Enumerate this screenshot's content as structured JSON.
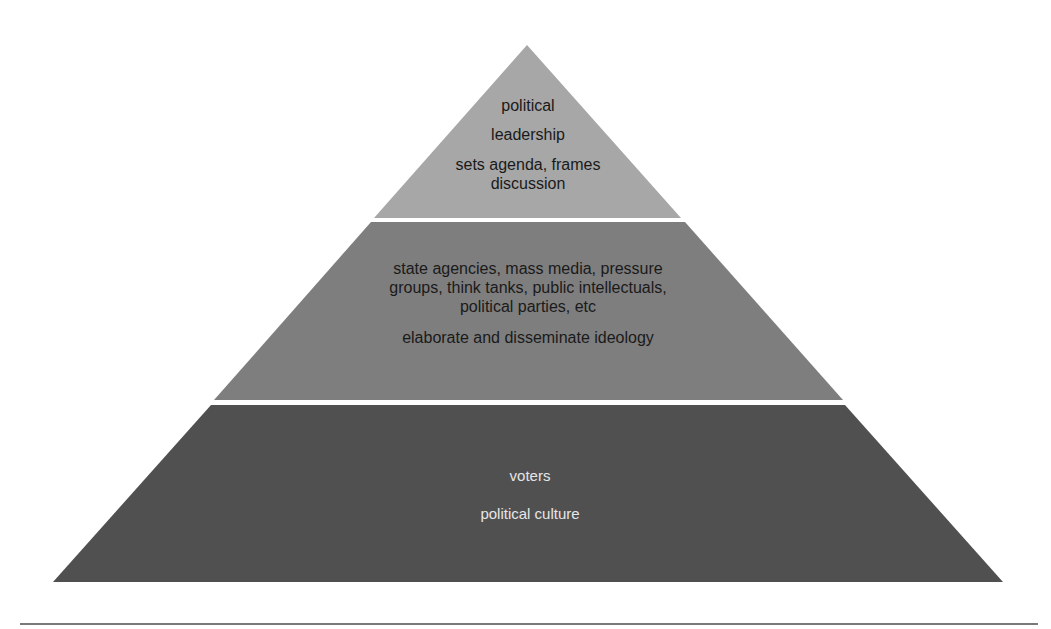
{
  "diagram": {
    "type": "pyramid",
    "colors": {
      "top": "#a7a7a7",
      "middle": "#7e7e7e",
      "bottom": "#505050",
      "separator": "#ffffff",
      "dark_text": "#1a1a1a",
      "light_text": "#e6e6e6"
    },
    "tiers": [
      {
        "id": "top",
        "title_line1": "political",
        "title_line2": "leadership",
        "role_line1": "sets agenda, frames",
        "role_line2": "discussion"
      },
      {
        "id": "middle",
        "actors_line1": "state agencies, mass media, pressure",
        "actors_line2": "groups, think tanks, public intellectuals,",
        "actors_line3": "political parties, etc",
        "role": "elaborate and disseminate ideology"
      },
      {
        "id": "bottom",
        "title": "voters",
        "role": "political culture"
      }
    ]
  }
}
